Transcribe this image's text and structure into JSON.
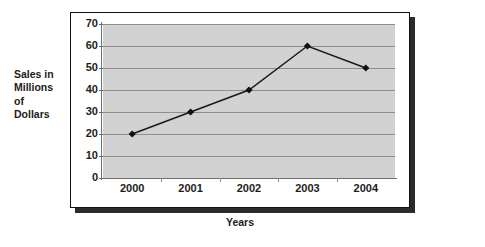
{
  "chart_data": {
    "type": "line",
    "title": "",
    "xlabel": "Years",
    "ylabel": "Sales in\nMillions\nof\nDollars",
    "categories": [
      "2000",
      "2001",
      "2002",
      "2003",
      "2004"
    ],
    "values": [
      20,
      30,
      40,
      60,
      50
    ],
    "series": [
      {
        "name": "Sales",
        "values": [
          20,
          30,
          40,
          60,
          50
        ]
      }
    ],
    "ylim": [
      0,
      70
    ],
    "y_ticks": [
      "0",
      "10",
      "20",
      "30",
      "40",
      "50",
      "60",
      "70"
    ],
    "y_tick_values": [
      0,
      10,
      20,
      30,
      40,
      50,
      60,
      70
    ],
    "grid": true,
    "legend": "none",
    "marker": "diamond",
    "colors": {
      "line": "#1a1a1a",
      "marker": "#111111",
      "plot_background": "#d2d2d2",
      "gridline": "#8e8e8e",
      "frame_border": "#111111",
      "frame_shadow": "#2b2b2b",
      "text": "#1c1c1c",
      "page_background": "#ffffff"
    }
  }
}
